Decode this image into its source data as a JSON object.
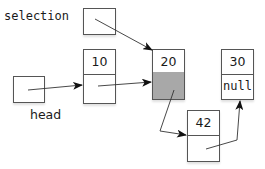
{
  "labels": {
    "selection": "selection",
    "head": "head"
  },
  "nodes": [
    {
      "id": "n10",
      "value": "10",
      "next": "",
      "next_highlighted": false
    },
    {
      "id": "n20",
      "value": "20",
      "next": "",
      "next_highlighted": true
    },
    {
      "id": "n30",
      "value": "30",
      "next": "null",
      "next_highlighted": false
    },
    {
      "id": "n42",
      "value": "42",
      "next": "",
      "next_highlighted": false
    }
  ],
  "colors": {
    "stroke": "#555555",
    "arrow": "#222222",
    "highlight_fill": "#a8a8a8"
  },
  "links": [
    {
      "from": "selection",
      "to": "20"
    },
    {
      "from": "head",
      "to": "10"
    },
    {
      "from": "10",
      "to": "20"
    },
    {
      "from": "20",
      "to": "42"
    },
    {
      "from": "42",
      "to": "30"
    }
  ]
}
